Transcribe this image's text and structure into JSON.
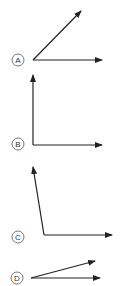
{
  "options": [
    {
      "label": "A",
      "description": "acute angle",
      "circle": [
        18,
        60
      ],
      "vertex": [
        33,
        60
      ],
      "rays": [
        [
          81,
          11
        ],
        [
          102,
          60
        ]
      ]
    },
    {
      "label": "B",
      "description": "right angle",
      "circle": [
        18,
        144
      ],
      "vertex": [
        33,
        145
      ],
      "rays": [
        [
          33,
          75
        ],
        [
          102,
          145
        ]
      ]
    },
    {
      "label": "C",
      "description": "obtuse angle",
      "circle": [
        18,
        237
      ],
      "vertex": [
        44,
        235
      ],
      "rays": [
        [
          33,
          167
        ],
        [
          112,
          235
        ]
      ]
    },
    {
      "label": "D",
      "description": "small acute angle",
      "circle": [
        17,
        278
      ],
      "vertex": [
        31,
        278
      ],
      "rays": [
        [
          95,
          261
        ],
        [
          100,
          278
        ]
      ]
    }
  ],
  "colors": {
    "stroke": "#222222",
    "circle": "#555555"
  }
}
